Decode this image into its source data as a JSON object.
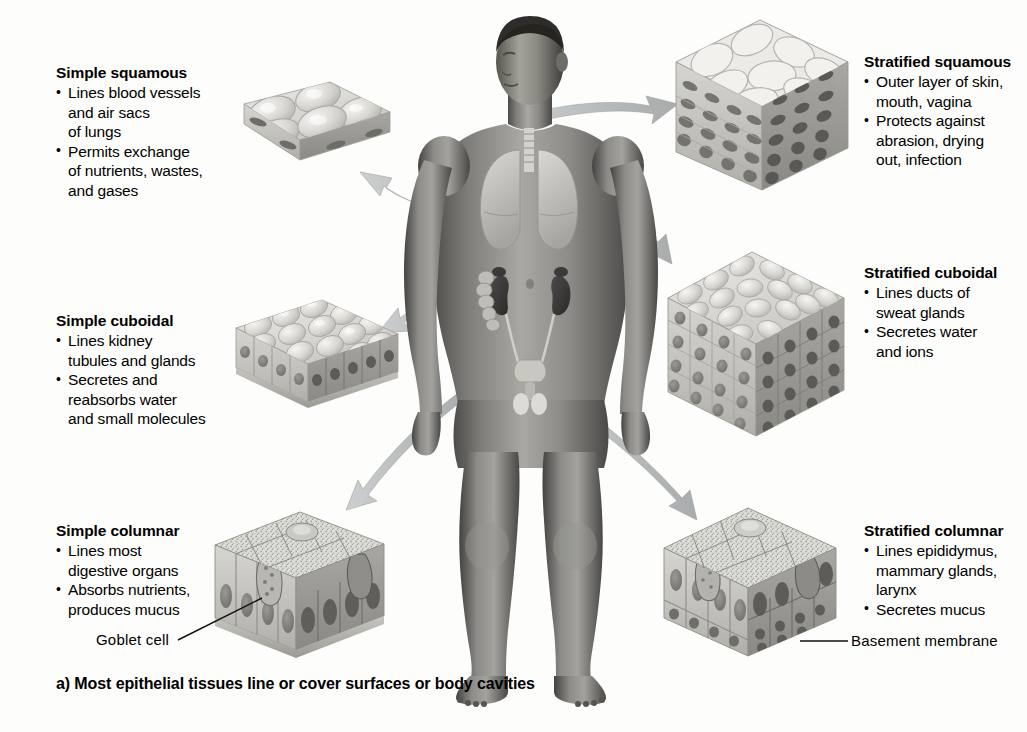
{
  "figure": {
    "caption": "a) Most epithelial tissues line or cover surfaces or body cavities",
    "background_color": "#fdfdfb",
    "arrow_color": "#b9bcbd",
    "body_tone": "#8e8f8d"
  },
  "panels": [
    {
      "id": "simple-squamous",
      "side": "left",
      "title": "Simple squamous",
      "bullets": [
        [
          "Lines blood vessels",
          "and air sacs",
          "of lungs"
        ],
        [
          "Permits exchange",
          "of nutrients, wastes,",
          "and gases"
        ]
      ]
    },
    {
      "id": "simple-cuboidal",
      "side": "left",
      "title": "Simple cuboidal",
      "bullets": [
        [
          "Lines kidney",
          "tubules and glands"
        ],
        [
          "Secretes and",
          "reabsorbs water",
          "and small molecules"
        ]
      ]
    },
    {
      "id": "simple-columnar",
      "side": "left",
      "title": "Simple columnar",
      "bullets": [
        [
          "Lines most",
          "digestive organs"
        ],
        [
          "Absorbs nutrients,",
          "produces mucus"
        ]
      ]
    },
    {
      "id": "stratified-squamous",
      "side": "right",
      "title": "Stratified squamous",
      "bullets": [
        [
          "Outer layer of skin,",
          "mouth, vagina"
        ],
        [
          "Protects against",
          "abrasion, drying",
          "out, infection"
        ]
      ]
    },
    {
      "id": "stratified-cuboidal",
      "side": "right",
      "title": "Stratified cuboidal",
      "bullets": [
        [
          "Lines ducts of",
          "sweat glands"
        ],
        [
          "Secretes water",
          "and ions"
        ]
      ]
    },
    {
      "id": "stratified-columnar",
      "side": "right",
      "title": "Stratified columnar",
      "bullets": [
        [
          "Lines epididymus,",
          "mammary glands,",
          "larynx"
        ],
        [
          "Secretes mucus"
        ]
      ]
    }
  ],
  "leaders": [
    {
      "id": "goblet-cell",
      "text": "Goblet  cell"
    },
    {
      "id": "basement-membrane",
      "text": "Basement membrane"
    }
  ],
  "body_figure": {
    "name": "human-male-anatomy-figure",
    "organs": [
      "trachea",
      "lungs",
      "kidneys",
      "ureters",
      "bladder",
      "intestines",
      "testes"
    ]
  }
}
